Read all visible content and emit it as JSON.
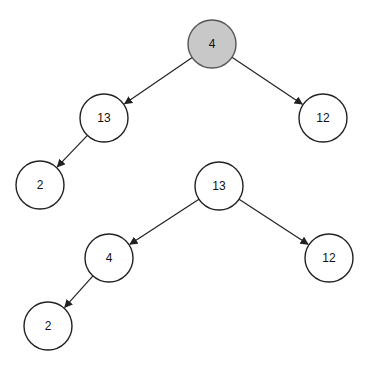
{
  "diagram": {
    "tree1": {
      "nodes": [
        {
          "id": "t1n0",
          "value": "4",
          "x": 212,
          "y": 44,
          "highlight": true
        },
        {
          "id": "t1n1",
          "value": "13",
          "x": 104,
          "y": 118,
          "highlight": false
        },
        {
          "id": "t1n2",
          "value": "12",
          "x": 323,
          "y": 118,
          "highlight": false
        },
        {
          "id": "t1n3",
          "value": "2",
          "x": 40,
          "y": 185,
          "highlight": false
        }
      ],
      "edges": [
        {
          "from": "t1n0",
          "to": "t1n1"
        },
        {
          "from": "t1n0",
          "to": "t1n2"
        },
        {
          "from": "t1n1",
          "to": "t1n3"
        }
      ]
    },
    "tree2": {
      "nodes": [
        {
          "id": "t2n0",
          "value": "13",
          "x": 219,
          "y": 186,
          "highlight": false
        },
        {
          "id": "t2n1",
          "value": "4",
          "x": 109,
          "y": 258,
          "highlight": false
        },
        {
          "id": "t2n2",
          "value": "12",
          "x": 329,
          "y": 258,
          "highlight": false
        },
        {
          "id": "t2n3",
          "value": "2",
          "x": 48,
          "y": 326,
          "highlight": false
        }
      ],
      "edges": [
        {
          "from": "t2n0",
          "to": "t2n1"
        },
        {
          "from": "t2n0",
          "to": "t2n2"
        },
        {
          "from": "t2n1",
          "to": "t2n3"
        }
      ]
    },
    "node_radius": 24,
    "colors": {
      "highlight_fill": "#c8c8c8",
      "stroke": "#222222"
    }
  }
}
